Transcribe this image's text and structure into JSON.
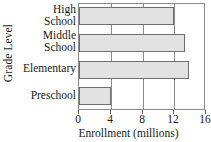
{
  "chart_data": {
    "type": "bar",
    "orientation": "horizontal",
    "title": "",
    "xlabel": "Enrollment (millions)",
    "ylabel": "Grade Level",
    "categories": [
      "High School",
      "Middle School",
      "Elementary",
      "Preschool"
    ],
    "values": [
      12,
      13.3,
      13.8,
      4
    ],
    "xlim": [
      0,
      16
    ],
    "xticks": [
      0,
      4,
      8,
      12,
      16
    ],
    "xtick_labels": [
      "0",
      "4",
      "8",
      "12",
      "16"
    ],
    "grid": true,
    "grid_axis": "x",
    "legend": false,
    "bar_fill_color": "#e2e2e2",
    "bar_edge_color": "#6f6f6f",
    "axis_color": "#8a8a8a",
    "category_label_lines": [
      [
        "High",
        "School"
      ],
      [
        "Middle",
        "School"
      ],
      [
        "Elementary"
      ],
      [
        "Preschool"
      ]
    ]
  }
}
